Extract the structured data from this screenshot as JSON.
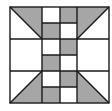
{
  "diagram": {
    "title": "",
    "type": "quilt-block",
    "colors": {
      "shade": "#a6a6a6",
      "background": "#ffffff",
      "line": "#1a1a1a"
    },
    "grid": {
      "rows": 3,
      "cols": 3
    },
    "corners": [
      {
        "position": "top-left",
        "shaded": "upper-right-triangle"
      },
      {
        "position": "top-right",
        "shaded": "upper-left-triangle"
      },
      {
        "position": "bottom-left",
        "shaded": "lower-right-triangle"
      },
      {
        "position": "bottom-right",
        "shaded": "lower-left-triangle"
      }
    ],
    "center_column_pattern": [
      "white-gray",
      "gray-white",
      "white-gray",
      "gray-white",
      "white-gray",
      "gray-white"
    ]
  }
}
